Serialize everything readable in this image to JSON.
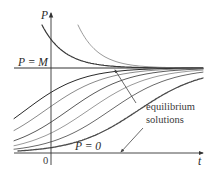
{
  "figure": {
    "axis_labels": {
      "vertical": "P",
      "horizontal": "t",
      "origin": "0"
    },
    "equilibria": [
      {
        "label": "P = M",
        "value": "M"
      },
      {
        "label": "P = 0",
        "value": "0"
      }
    ],
    "annotation": {
      "line1": "equilibrium",
      "line2": "solutions"
    },
    "curve_groups": [
      {
        "name": "decreasing solutions above M",
        "count": 2,
        "colors": [
          "#3a3a3a",
          "#9a9a9a"
        ]
      },
      {
        "name": "increasing solutions between 0 and M",
        "count": 6,
        "colors": [
          "#2a2a2a",
          "#8a8a8a",
          "#5a5a5a",
          "#9a9a9a",
          "#6a6a6a",
          "#4a4a4a"
        ]
      }
    ]
  }
}
